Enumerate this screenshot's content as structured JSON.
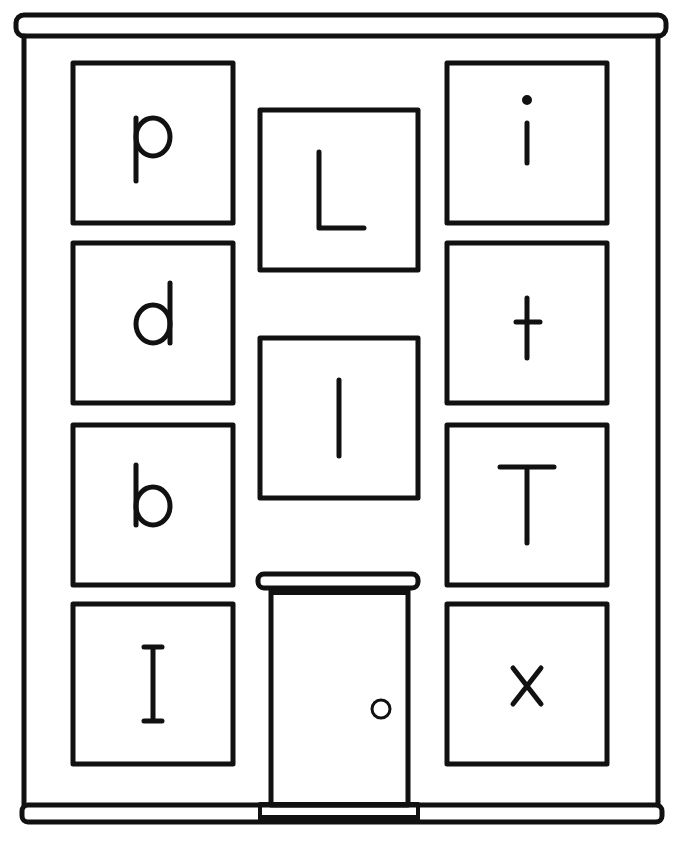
{
  "colors": {
    "ink": "#111111",
    "paper": "#ffffff"
  },
  "building": {
    "left_column": [
      {
        "letter": "p",
        "x": 73,
        "y": 63,
        "w": 160,
        "h": 160
      },
      {
        "letter": "d",
        "x": 73,
        "y": 243,
        "w": 160,
        "h": 160
      },
      {
        "letter": "b",
        "x": 73,
        "y": 425,
        "w": 160,
        "h": 160
      },
      {
        "letter": "I",
        "x": 73,
        "y": 604,
        "w": 160,
        "h": 160
      }
    ],
    "middle_column": [
      {
        "letter": "L",
        "x": 260,
        "y": 110,
        "w": 158,
        "h": 160
      },
      {
        "letter": "l",
        "x": 260,
        "y": 338,
        "w": 158,
        "h": 160
      }
    ],
    "right_column": [
      {
        "letter": "i",
        "x": 447,
        "y": 63,
        "w": 160,
        "h": 160
      },
      {
        "letter": "t",
        "x": 447,
        "y": 243,
        "w": 160,
        "h": 160
      },
      {
        "letter": "T",
        "x": 447,
        "y": 425,
        "w": 160,
        "h": 160
      },
      {
        "letter": "x",
        "x": 447,
        "y": 604,
        "w": 160,
        "h": 160
      }
    ],
    "door": {
      "label": "door"
    }
  }
}
